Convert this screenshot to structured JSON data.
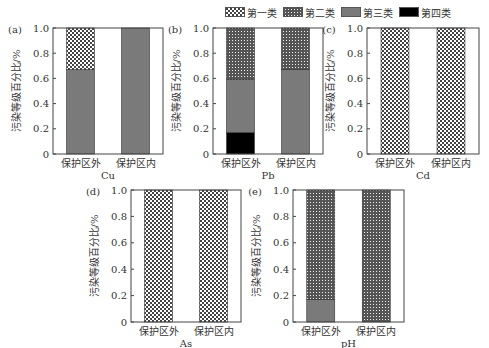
{
  "legend": [
    {
      "key": "c1",
      "label": "第一类",
      "pattern": "cross-large"
    },
    {
      "key": "c2",
      "label": "第二类",
      "pattern": "cross-fine"
    },
    {
      "key": "c3",
      "label": "第三类",
      "color": "#7a7a7a"
    },
    {
      "key": "c4",
      "label": "第四类",
      "color": "#000000"
    }
  ],
  "ylabel": "污染等级百分比/%",
  "chart_data": [
    {
      "type": "bar",
      "stacked": true,
      "panel": "(a)",
      "xlabel": "Cu",
      "categories": [
        "保护区外",
        "保护区内"
      ],
      "series": [
        {
          "name": "第四类",
          "values": [
            0,
            0
          ]
        },
        {
          "name": "第三类",
          "values": [
            0.67,
            1.0
          ]
        },
        {
          "name": "第二类",
          "values": [
            0,
            0
          ]
        },
        {
          "name": "第一类",
          "values": [
            0.33,
            0
          ]
        }
      ],
      "ylim": [
        0,
        1.0
      ],
      "yticks": [
        "0",
        "0.2",
        "0.4",
        "0.6",
        "0.8",
        "1.0"
      ]
    },
    {
      "type": "bar",
      "stacked": true,
      "panel": "(b)",
      "xlabel": "Pb",
      "categories": [
        "保护区外",
        "保护区内"
      ],
      "series": [
        {
          "name": "第四类",
          "values": [
            0.17,
            0
          ]
        },
        {
          "name": "第三类",
          "values": [
            0.42,
            0.67
          ]
        },
        {
          "name": "第二类",
          "values": [
            0.41,
            0.33
          ]
        },
        {
          "name": "第一类",
          "values": [
            0,
            0
          ]
        }
      ],
      "ylim": [
        0,
        1.0
      ],
      "yticks": [
        "0",
        "0.2",
        "0.4",
        "0.6",
        "0.8",
        "1.0"
      ]
    },
    {
      "type": "bar",
      "stacked": true,
      "panel": "(c)",
      "xlabel": "Cd",
      "categories": [
        "保护区外",
        "保护区内"
      ],
      "series": [
        {
          "name": "第四类",
          "values": [
            0,
            0
          ]
        },
        {
          "name": "第三类",
          "values": [
            0,
            0
          ]
        },
        {
          "name": "第二类",
          "values": [
            0,
            0
          ]
        },
        {
          "name": "第一类",
          "values": [
            1.0,
            1.0
          ]
        }
      ],
      "ylim": [
        0,
        1.0
      ],
      "yticks": [
        "0",
        "0.2",
        "0.4",
        "0.6",
        "0.8",
        "1.0"
      ]
    },
    {
      "type": "bar",
      "stacked": true,
      "panel": "(d)",
      "xlabel": "As",
      "categories": [
        "保护区外",
        "保护区内"
      ],
      "series": [
        {
          "name": "第四类",
          "values": [
            0,
            0
          ]
        },
        {
          "name": "第三类",
          "values": [
            0,
            0
          ]
        },
        {
          "name": "第二类",
          "values": [
            0,
            0
          ]
        },
        {
          "name": "第一类",
          "values": [
            1.0,
            1.0
          ]
        }
      ],
      "ylim": [
        0,
        1.0
      ],
      "yticks": [
        "0",
        "0.2",
        "0.4",
        "0.6",
        "0.8",
        "1.0"
      ]
    },
    {
      "type": "bar",
      "stacked": true,
      "panel": "(e)",
      "xlabel": "pH",
      "categories": [
        "保护区外",
        "保护区内"
      ],
      "series": [
        {
          "name": "第四类",
          "values": [
            0,
            0
          ]
        },
        {
          "name": "第三类",
          "values": [
            0.17,
            0
          ]
        },
        {
          "name": "第二类",
          "values": [
            0.83,
            1.0
          ]
        },
        {
          "name": "第一类",
          "values": [
            0,
            0
          ]
        }
      ],
      "ylim": [
        0,
        1.0
      ],
      "yticks": [
        "0",
        "0.2",
        "0.4",
        "0.6",
        "0.8",
        "1.0"
      ]
    }
  ]
}
